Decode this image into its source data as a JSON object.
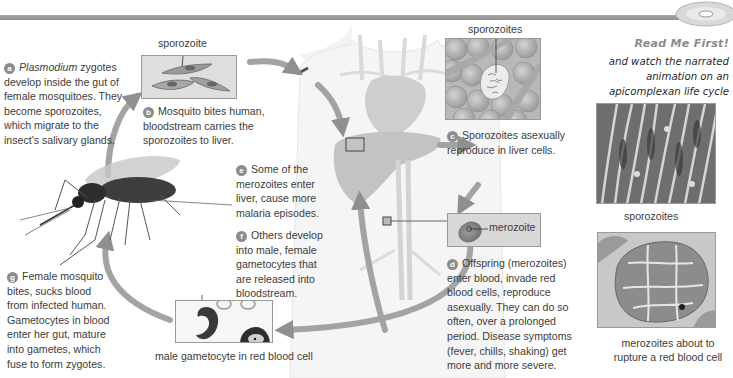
{
  "header": {
    "cd_icon": "cd-rom-icon",
    "read_me_first": "Read Me First!",
    "read_me_text": [
      "and watch the narrated",
      "animation on an",
      "apicomplexan life cycle"
    ]
  },
  "steps": {
    "a": {
      "letter": "a",
      "italic_word": "Plasmodium",
      "text_lines": [
        " zygotes",
        "develop inside the gut of",
        "female mosquitoes. They",
        "become sporozoites,",
        "which migrate to the",
        "insect's salivary glands."
      ]
    },
    "b": {
      "letter": "b",
      "text_lines": [
        "Mosquito bites human,",
        "bloodstream carries the",
        "sporozoites to liver."
      ]
    },
    "c": {
      "letter": "c",
      "text_lines": [
        "Sporozoites asexually",
        "reproduce in liver cells."
      ]
    },
    "d": {
      "letter": "d",
      "text_lines": [
        "Offspring (merozoites)",
        "enter blood, invade red",
        "blood cells, reproduce",
        "asexually. They can do so",
        "often, over a prolonged",
        "period. Disease symptoms",
        "(fever, chills, shaking) get",
        "more and more severe."
      ]
    },
    "e": {
      "letter": "e",
      "text_lines": [
        "Some of the",
        "merozoites enter",
        "liver, cause more",
        "malaria episodes."
      ]
    },
    "f": {
      "letter": "f",
      "text_lines": [
        "Others develop",
        "into male, female",
        "gametocytes that",
        "are released into",
        "bloodstream."
      ]
    },
    "g": {
      "letter": "g",
      "text_lines": [
        "Female mosquito",
        "bites, sucks blood",
        "from infected human.",
        "Gametocytes in blood",
        "enter her gut, mature",
        "into gametes, which",
        "fuse to form zygotes."
      ]
    }
  },
  "labels": {
    "sporozoite": "sporozoite",
    "sporozoites_liver": "sporozoites",
    "merozoite": "merozoite",
    "male_gametocyte": "male gametocyte in red blood cell"
  },
  "micrographs": {
    "sporozoites_caption": "sporozoites",
    "merozoites_caption_lines": [
      "merozoites about to",
      "rupture a red blood cell"
    ]
  },
  "colors": {
    "arrow": "#9a9a9a",
    "badge": "#8c8c8c",
    "text": "#3c3c3c",
    "panel_bg": "#e4e4e4",
    "rbc": "#b8b8b8"
  }
}
